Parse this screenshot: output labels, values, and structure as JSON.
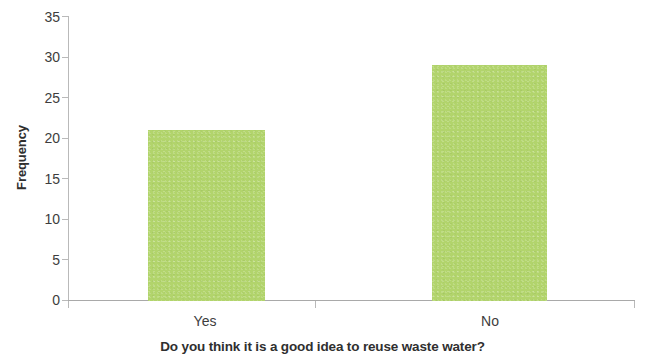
{
  "chart_data": {
    "type": "bar",
    "title": "",
    "subtitle": "",
    "categories": [
      "Yes",
      "No"
    ],
    "values": [
      21,
      29
    ],
    "series": [
      {
        "name": "Frequency",
        "values": [
          21,
          29
        ]
      }
    ],
    "xlabel": "Do you think it is a good idea to reuse waste water?",
    "ylabel": "Frequency",
    "ylim": [
      0,
      35
    ],
    "ytick_values": [
      0,
      5,
      10,
      15,
      20,
      25,
      30,
      35
    ],
    "ytick_labels": [
      "0",
      "5",
      "10",
      "15",
      "20",
      "25",
      "30",
      "35"
    ],
    "ytick_interval": 5,
    "grid": false,
    "legend": false,
    "legend_position": "none",
    "bar_color": "#b2d46c",
    "axis_color": "#b9b9b9",
    "text_color": "#3d3d3d",
    "background_color": "#ffffff",
    "annotations": []
  },
  "axes": {
    "y_label": "Frequency",
    "x_label": "Do you think it is a good idea to reuse waste water?",
    "y_ticks": [
      {
        "label": "35",
        "value": 35
      },
      {
        "label": "30",
        "value": 30
      },
      {
        "label": "25",
        "value": 25
      },
      {
        "label": "20",
        "value": 20
      },
      {
        "label": "15",
        "value": 15
      },
      {
        "label": "10",
        "value": 10
      },
      {
        "label": "5",
        "value": 5
      },
      {
        "label": "0",
        "value": 0
      }
    ],
    "x_categories": [
      {
        "label": "Yes",
        "value": 21
      },
      {
        "label": "No",
        "value": 29
      }
    ]
  }
}
